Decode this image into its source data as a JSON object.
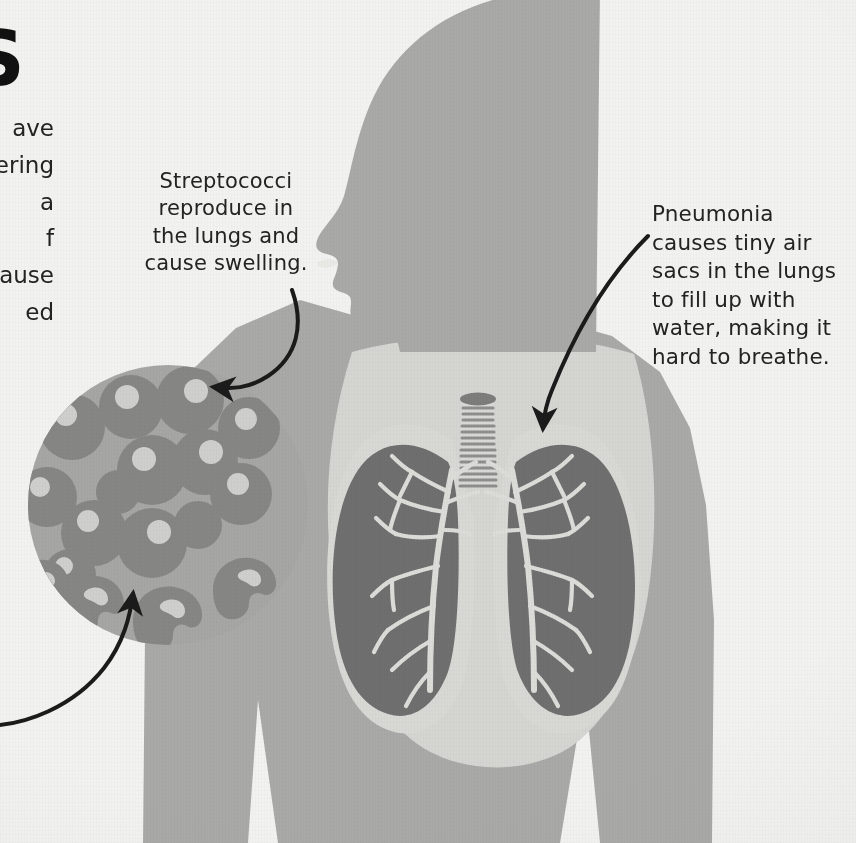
{
  "page": {
    "kind": "printed-infographic-page",
    "background_color": "#f2f2f0"
  },
  "palette": {
    "paper": "#f2f2f0",
    "body_silhouette": "#a9a9a7",
    "chest_light": "#d5d5d2",
    "lung_dark": "#6f6f6f",
    "lung_halo": "#d8d8d4",
    "inset_circle": "#a6a6a4",
    "bacteria_cell": "#868684",
    "bacteria_highlight": "#cfcfcc",
    "trachea_light": "#d9d9d6",
    "trachea_ring": "#8e8e8c",
    "ink": "#232323"
  },
  "cropped_left_column": {
    "title_fragment": "S",
    "body_line_fragments": [
      "ave",
      "fering",
      "a",
      "f",
      "ause",
      "ed"
    ]
  },
  "annotations": [
    {
      "id": "streptococci-note",
      "lines": [
        "Streptococci",
        "reproduce in",
        "the lungs and",
        "cause swelling."
      ],
      "text": "Streptococci reproduce in the lungs and cause swelling.",
      "points_to": "bacteria-inset-circle"
    },
    {
      "id": "pneumonia-note",
      "lines": [
        "Pneumonia",
        "causes tiny air",
        "sacs in the lungs",
        "to fill up with",
        "water, making it",
        "hard to breathe."
      ],
      "text": "Pneumonia causes tiny air sacs in the lungs to fill up with water, making it hard to breathe.",
      "points_to": "right-lung-apex"
    }
  ],
  "arrows": [
    {
      "id": "arrow-to-bacteria",
      "from": "streptococci-note",
      "to": "bacteria-inset-circle",
      "style": "curved-with-arrowhead"
    },
    {
      "id": "arrow-to-lung",
      "from": "pneumonia-note",
      "to": "right-lung-apex",
      "style": "curved-with-arrowhead"
    },
    {
      "id": "arrow-from-left-edge",
      "from": "off-page-left-text",
      "to": "crescent-bacteria",
      "style": "curved-with-arrowhead"
    }
  ],
  "figure": {
    "silhouette": "human head in left-facing profile with neck, shoulders, torso and arms",
    "organs": [
      "trachea",
      "left lung",
      "right lung",
      "bronchial tree"
    ],
    "trachea_rings": 14,
    "inset": {
      "label": "magnified view of streptococci bacteria",
      "round_cells": 13,
      "crescent_cells": 5
    }
  }
}
